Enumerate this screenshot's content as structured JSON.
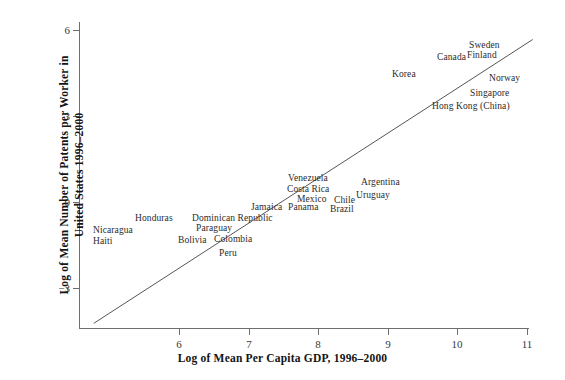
{
  "chart_data": {
    "type": "scatter",
    "title": "",
    "xlabel": "Log of Mean Per Capita GDP, 1996–2000",
    "ylabel_line1": "Log of Mean Number of Patents per Worker in",
    "ylabel_line2": "United States 1996–2000",
    "xlim": [
      5.1,
      11.2
    ],
    "ylim": [
      -3.9,
      6.6
    ],
    "xticks": [
      6,
      7,
      8,
      9,
      10,
      11
    ],
    "xtick_labels": [
      "6",
      "7",
      "8",
      "9",
      "10",
      "11"
    ],
    "yticks": [
      6,
      3,
      0,
      -3
    ],
    "ytick_labels": [
      "6",
      "3",
      "0",
      "−3"
    ],
    "grid": false,
    "legend": null,
    "marker_style": "text-labels-only",
    "fit_line": {
      "x_start": 5.3,
      "y_start": -3.74,
      "x_end": 11.25,
      "y_end": 6.0,
      "color": "#555555"
    },
    "points": [
      {
        "label": "Haiti",
        "x": 5.75,
        "y": -1.34
      },
      {
        "label": "Nicaragua",
        "x": 5.75,
        "y": -0.99
      },
      {
        "label": "Honduras",
        "x": 6.35,
        "y": -0.55
      },
      {
        "label": "Bolivia",
        "x": 6.95,
        "y": -1.31
      },
      {
        "label": "Paraguay",
        "x": 7.22,
        "y": -0.9
      },
      {
        "label": "Dominican Republic",
        "x": 7.45,
        "y": -0.55
      },
      {
        "label": "Colombia",
        "x": 7.55,
        "y": -1.24
      },
      {
        "label": "Peru",
        "x": 7.55,
        "y": -1.74
      },
      {
        "label": "Jamaica",
        "x": 7.65,
        "y": -0.1
      },
      {
        "label": "Panama",
        "x": 7.9,
        "y": -0.17
      },
      {
        "label": "Costa Rica",
        "x": 7.95,
        "y": 0.49
      },
      {
        "label": "Venezuela",
        "x": 8.0,
        "y": 0.83
      },
      {
        "label": "Mexico",
        "x": 8.1,
        "y": 0.14
      },
      {
        "label": "Brazil",
        "x": 8.25,
        "y": -0.24
      },
      {
        "label": "Chile",
        "x": 8.55,
        "y": 0.07
      },
      {
        "label": "Uruguay",
        "x": 8.75,
        "y": 0.21
      },
      {
        "label": "Argentina",
        "x": 8.95,
        "y": 0.7
      },
      {
        "label": "Korea",
        "x": 9.0,
        "y": 4.5
      },
      {
        "label": "Hong Kong (China)",
        "x": 9.65,
        "y": 3.38
      },
      {
        "label": "Singapore",
        "x": 9.95,
        "y": 3.83
      },
      {
        "label": "Canada",
        "x": 10.05,
        "y": 5.5
      },
      {
        "label": "Finland",
        "x": 10.3,
        "y": 5.2
      },
      {
        "label": "Sweden",
        "x": 10.35,
        "y": 5.75
      },
      {
        "label": "Norway",
        "x": 10.6,
        "y": 4.33
      }
    ]
  },
  "labels": {
    "haiti": "Haiti",
    "nicaragua": "Nicaragua",
    "honduras": "Honduras",
    "bolivia": "Bolivia",
    "paraguay": "Paraguay",
    "dominican_republic": "Dominican Republic",
    "colombia": "Colombia",
    "peru": "Peru",
    "jamaica": "Jamaica",
    "panama": "Panama",
    "costa_rica": "Costa Rica",
    "venezuela": "Venezuela",
    "mexico": "Mexico",
    "brazil": "Brazil",
    "chile": "Chile",
    "uruguay": "Uruguay",
    "argentina": "Argentina",
    "korea": "Korea",
    "hong_kong": "Hong Kong (China)",
    "singapore": "Singapore",
    "canada": "Canada",
    "finland": "Finland",
    "sweden": "Sweden",
    "norway": "Norway"
  },
  "axes": {
    "x_title": "Log of Mean Per Capita GDP, 1996–2000",
    "y_title_line1": "Log of Mean Number of Patents per Worker in",
    "y_title_line2": "United States 1996–2000",
    "x_tick_6": "6",
    "x_tick_7": "7",
    "x_tick_8": "8",
    "x_tick_9": "9",
    "x_tick_10": "10",
    "x_tick_11": "11",
    "y_tick_6": "6",
    "y_tick_3": "3",
    "y_tick_0": "0",
    "y_tick_neg3": "−3"
  },
  "colors": {
    "axis": "#6e6e6e",
    "line": "#555555",
    "text": "#1a1a1a",
    "background": "#ffffff"
  }
}
